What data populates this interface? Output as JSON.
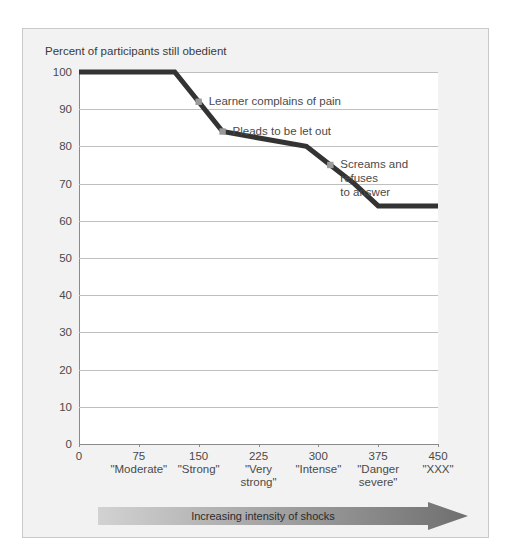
{
  "chart_data": {
    "type": "line",
    "title": "Percent of participants still obedient",
    "xlabel": "",
    "ylabel": "",
    "xlim": [
      0,
      450
    ],
    "ylim": [
      0,
      100
    ],
    "grid": true,
    "legend": "none",
    "x": [
      0,
      120,
      150,
      180,
      285,
      315,
      345,
      375,
      450
    ],
    "values": [
      100,
      100,
      92,
      84,
      80,
      75,
      70,
      64,
      64
    ],
    "y_ticks": [
      0,
      10,
      20,
      30,
      40,
      50,
      60,
      70,
      80,
      90,
      100
    ],
    "x_ticks": [
      0,
      75,
      150,
      225,
      300,
      375,
      450
    ],
    "x_tick_sublabels": [
      "",
      "\"Moderate\"",
      "\"Strong\"",
      "\"Very\nstrong\"",
      "\"Intense\"",
      "\"Danger\nsevere\"",
      "\"XXX\""
    ],
    "annotations": [
      {
        "text": "Learner complains of pain",
        "x": 150,
        "y": 92
      },
      {
        "text": "Pleads to be let out",
        "x": 180,
        "y": 84
      },
      {
        "text": "Screams and refuses\nto answer",
        "x": 315,
        "y": 75
      }
    ],
    "series_color": "#333333",
    "marker_color": "#9a9a9a",
    "grid_color": "#bfbfbf",
    "axis_color": "#8a8a8a"
  },
  "footer": {
    "arrow_label": "Increasing intensity of shocks",
    "arrow_gradient_start": "#d2d2d2",
    "arrow_gradient_end": "#6f6f6f"
  },
  "figure": {
    "background": "#f2f2f2",
    "border_color": "#c9c9c9",
    "plot_background": "#ffffff"
  }
}
